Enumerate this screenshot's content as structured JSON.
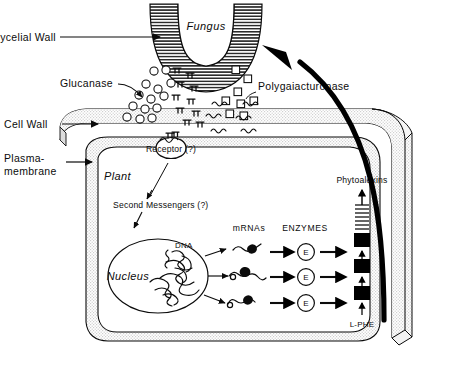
{
  "figure": {
    "organism_labels": {
      "fungus": "Fungus",
      "plant": "Plant",
      "nucleus": "Nucleus"
    },
    "structure_labels": {
      "mycelial_wall": "Mycelial Wall",
      "cell_wall": "Cell Wall",
      "plasma_membrane_line1": "Plasma-",
      "plasma_membrane_line2": "membrane",
      "receptor": "Receptor (?)",
      "dna": "DNA"
    },
    "enzyme_labels": {
      "glucanase": "Glucanase",
      "polygalacturonase": "Polygaiacturonase"
    },
    "signal_labels": {
      "second_messengers": "Second  Messengers (?)"
    },
    "pathway_headers": {
      "mrnas": "mRNAs",
      "enzymes": "ENZYMES"
    },
    "pathway_nodes": {
      "enzyme_symbol": "E",
      "substrate": "L-PHE",
      "product": "Phytoalexins"
    },
    "enzyme_rows": [
      {
        "symbol": "E"
      },
      {
        "symbol": "E"
      },
      {
        "symbol": "E"
      }
    ],
    "colors": {
      "ink": "#0b0b0b",
      "wall_fill": "#e8e8e8",
      "cytoplasm_fill": "#efefef",
      "hatch": "#2b2b2b",
      "paper": "#ffffff",
      "black_block": "#000000"
    }
  }
}
